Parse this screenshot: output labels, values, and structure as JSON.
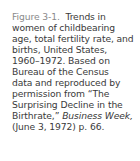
{
  "caption": {
    "figure_label": "Figure 3-1.",
    "lines": [
      "Trends in",
      "women of childbearing",
      "age, total fertility rate, and",
      "births, United States,",
      "1960–1972. Based on",
      "Bureau of the Census",
      "data and reproduced by",
      "permission from “The",
      "Surprising Decline in the",
      "Birthrate,”",
      "Business Week,",
      "(June 3, 1972) p. 66."
    ]
  }
}
